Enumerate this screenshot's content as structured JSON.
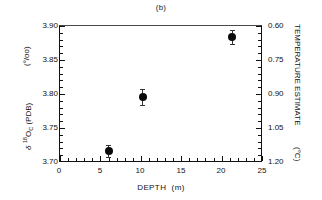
{
  "panel": {
    "title": "(b)"
  },
  "chart_data": {
    "type": "scatter",
    "title": "(b)",
    "xlabel": "DEPTH   (m)",
    "ylabel": "δ 18OC (PDB)  (o/oo)",
    "ylabel_right": "TEMPERATURE ESTIMATE   (oC)",
    "xlim": [
      0,
      25
    ],
    "ylim": [
      3.7,
      3.9
    ],
    "ylim_right": [
      1.2,
      0.6
    ],
    "grid": false,
    "legend": null,
    "x": [
      6.0,
      10.2,
      21.2
    ],
    "y": [
      3.718,
      3.796,
      3.884
    ],
    "yerr": [
      0.009,
      0.012,
      0.01
    ],
    "xticks": [
      0,
      5,
      10,
      15,
      20,
      25
    ],
    "xticklabels": [
      "0",
      "5",
      "10",
      "15",
      "20",
      "25"
    ],
    "yticks": [
      3.7,
      3.75,
      3.8,
      3.85,
      3.9
    ],
    "yticklabels": [
      "3.70",
      "3.75",
      "3.80",
      "3.85",
      "3.90"
    ],
    "yticks_right": [
      0.6,
      0.75,
      0.9,
      1.05,
      1.2
    ],
    "yticklabels_right": [
      "0.60",
      "0.75",
      "0.90",
      "1.05",
      "1.20"
    ],
    "marker": "filled-circle",
    "marker_color": "#0a0a0a"
  },
  "axes": {
    "x": {
      "title_text": "DEPTH",
      "title_unit": "(m)",
      "labels": [
        "0",
        "5",
        "10",
        "15",
        "20",
        "25"
      ]
    },
    "y_left": {
      "title_main_delta": "δ",
      "title_main_iso": "18",
      "title_main_o": "O",
      "title_main_sub": "C",
      "title_main_tail": "(PDB)",
      "title_units": "(°/oo)",
      "labels": [
        "3.90",
        "3.85",
        "3.80",
        "3.75",
        "3.70"
      ]
    },
    "y_right": {
      "title_text": "TEMPERATURE ESTIMATE",
      "title_units": "(°C)",
      "labels": [
        "0.60",
        "0.75",
        "0.90",
        "1.05",
        "1.20"
      ]
    }
  }
}
